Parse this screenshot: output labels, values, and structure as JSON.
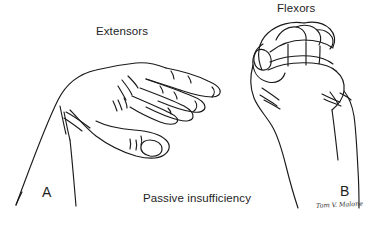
{
  "figure": {
    "title": "Passive insufficiency",
    "background_color": "#ffffff",
    "ink_color": "#1a1a1a",
    "text_color": "#242424",
    "width": 377,
    "height": 227
  },
  "labels": {
    "extensors": "Extensors",
    "flexors": "Flexors",
    "caption": "Passive insufficiency"
  },
  "panels": [
    {
      "id": "A",
      "letter": "A",
      "label": "Extensors",
      "description": "Hand with wrist flexed and fingers extended, thumb pointing right, forearm descending to lower left"
    },
    {
      "id": "B",
      "letter": "B",
      "label": "Flexors",
      "description": "Closed fist with wrist extended, forearm descending vertically"
    }
  ],
  "credit": {
    "signature": "Tom V. Malone"
  }
}
